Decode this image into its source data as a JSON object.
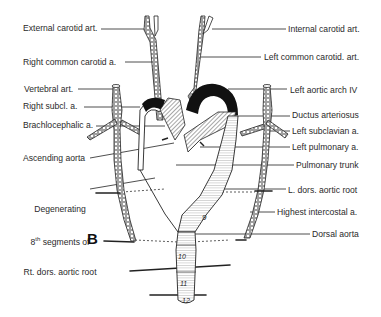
{
  "figure": {
    "panel_letter": "B"
  },
  "labels_left": [
    {
      "id": "external-carotid",
      "text": "External carotid art.",
      "x": 23,
      "y": 23
    },
    {
      "id": "right-common-carotid",
      "text": "Right common carotid a.",
      "x": 23,
      "y": 57
    },
    {
      "id": "vertebral",
      "text": "Vertebral art.",
      "x": 24,
      "y": 84
    },
    {
      "id": "right-subclavian",
      "text": "Right subcl. a.",
      "x": 23,
      "y": 101
    },
    {
      "id": "brachiocephalic",
      "text": "Brachlocephalic a.",
      "x": 23,
      "y": 120
    },
    {
      "id": "ascending-aorta",
      "text": "Ascending aorta",
      "x": 23,
      "y": 153
    }
  ],
  "degenerating_label": {
    "line1": "Degenerating",
    "line2": "8th segments of",
    "line2_base": "8",
    "line2_sup": "th",
    "line2_rest": " segments of",
    "line3": "Rt. dors. aortic root"
  },
  "labels_right": [
    {
      "id": "internal-carotid",
      "text": "Internal carotid art.",
      "x": 288,
      "y": 24
    },
    {
      "id": "left-common-carotid",
      "text": "Left common carotid. art.",
      "x": 264,
      "y": 52
    },
    {
      "id": "left-aortic-arch-iv",
      "text": "Left aortic arch IV",
      "x": 290,
      "y": 85
    },
    {
      "id": "ductus-arteriosus",
      "text": "Ductus arteriosus",
      "x": 292,
      "y": 110
    },
    {
      "id": "left-subclavian",
      "text": "Left subclavian a.",
      "x": 292,
      "y": 126
    },
    {
      "id": "left-pulmonary",
      "text": "Left pulmonary a.",
      "x": 292,
      "y": 142
    },
    {
      "id": "pulmonary-trunk",
      "text": "Pulmonary trunk",
      "x": 296,
      "y": 160
    },
    {
      "id": "l-dors-aortic-root",
      "text": "L. dors. aortic root",
      "x": 288,
      "y": 185
    },
    {
      "id": "highest-intercostal",
      "text": "Highest intercostal a.",
      "x": 277,
      "y": 207
    },
    {
      "id": "dorsal-aorta",
      "text": "Dorsal aorta",
      "x": 312,
      "y": 229
    }
  ],
  "segment_numbers": [
    "9",
    "10",
    "11",
    "12"
  ],
  "colors": {
    "ink": "#1a1a1a",
    "background": "#ffffff",
    "label_text": "#2a2a2a"
  }
}
